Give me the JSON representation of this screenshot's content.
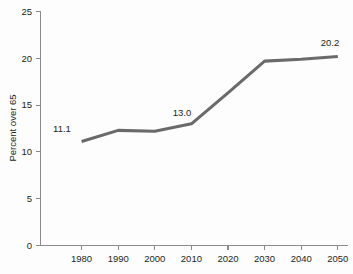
{
  "chart_data": {
    "type": "line",
    "title": "",
    "subtitle": "",
    "xlabel": "",
    "ylabel": "Percent over 65",
    "categories": [
      "1980",
      "1990",
      "2000",
      "2010",
      "2020",
      "2030",
      "2040",
      "2050"
    ],
    "x": [
      1980,
      1990,
      2000,
      2010,
      2020,
      2030,
      2040,
      2050
    ],
    "values": [
      11.1,
      12.3,
      12.2,
      13.0,
      16.3,
      19.7,
      19.9,
      20.2
    ],
    "series": [
      {
        "name": "Percent over 65",
        "color": "#6a6a6a",
        "values": [
          11.1,
          12.3,
          12.2,
          13.0,
          16.3,
          19.7,
          19.9,
          20.2
        ]
      }
    ],
    "xlim": [
      1975,
      2055
    ],
    "ylim": [
      0,
      25
    ],
    "yticks": [
      0,
      5,
      10,
      15,
      20,
      25
    ],
    "ytick_labels": [
      "0",
      "5",
      "10",
      "15",
      "20",
      "25"
    ],
    "xticks": [
      1980,
      1990,
      2000,
      2010,
      2020,
      2030,
      2040,
      2050
    ],
    "xtick_labels": [
      "1980",
      "1990",
      "2000",
      "2010",
      "2020",
      "2030",
      "2040",
      "2050"
    ],
    "grid": false,
    "legend": false,
    "legend_position": "none",
    "annotations": [
      {
        "text": "11.1",
        "x": 1980,
        "y": 11.1
      },
      {
        "text": "13.0",
        "x": 2010,
        "y": 13.0
      },
      {
        "text": "20.2",
        "x": 2050,
        "y": 20.2
      }
    ],
    "background_color": "#fdfdfd",
    "axis_color": "#8a8a8a",
    "text_color": "#231f20"
  }
}
